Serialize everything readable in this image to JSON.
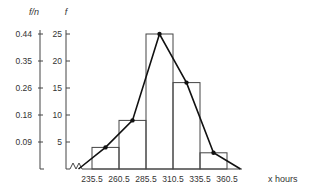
{
  "chart_data": {
    "type": "bar",
    "subtype": "histogram_with_frequency_polygon",
    "title": "",
    "xlabel": "x  hours",
    "ylabel": "f",
    "ylabel_secondary": "f/n",
    "bin_edges": [
      235.5,
      260.5,
      285.5,
      310.5,
      335.5,
      360.5
    ],
    "x_tick_labels": [
      "235.5",
      "260.5",
      "285.5",
      "310.5",
      "335.5",
      "360.5"
    ],
    "categories": [
      "235.5-260.5",
      "260.5-285.5",
      "285.5-310.5",
      "310.5-335.5",
      "335.5-360.5"
    ],
    "values": [
      4,
      9,
      25,
      16,
      3
    ],
    "relative_frequency_ticks": [
      {
        "f": 5,
        "label": "0.09"
      },
      {
        "f": 10,
        "label": "0.18"
      },
      {
        "f": 15,
        "label": "0.26"
      },
      {
        "f": 20,
        "label": "0.35"
      },
      {
        "f": 25,
        "label": "0.44"
      }
    ],
    "y_ticks": [
      5,
      10,
      15,
      20,
      25
    ],
    "ylim": [
      0,
      25
    ],
    "polygon": {
      "x": [
        223,
        248,
        273,
        298,
        323,
        348,
        373
      ],
      "y": [
        0,
        4,
        9,
        25,
        16,
        3,
        0
      ]
    },
    "axis_break": true,
    "grid": false,
    "legend": null
  }
}
